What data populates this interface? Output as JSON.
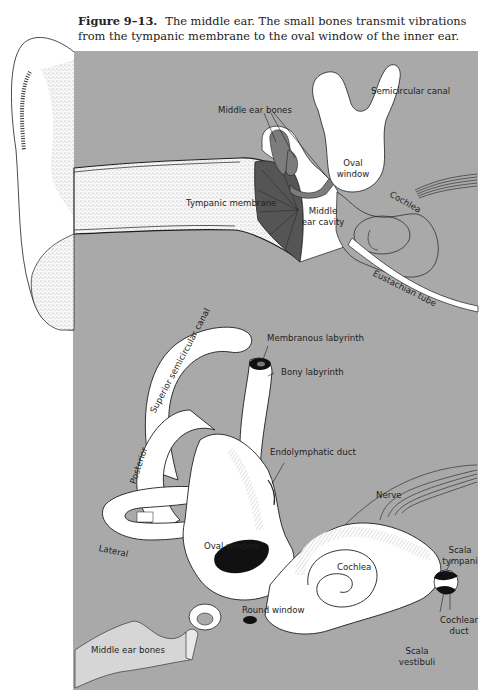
{
  "figure": {
    "number": "Figure 9–13.",
    "caption": "The middle ear. The small bones transmit vibrations from the tympanic membrane to the oval window of the inner ear."
  },
  "colors": {
    "panel_gray": "#a9a9a9",
    "page_white": "#ffffff",
    "line": "#1e1e1e",
    "dark_fill": "#111111",
    "bone_gray": "#7c7c7c"
  },
  "upper_diagram": {
    "title": "Middle ear cross-section",
    "labels": {
      "semicircular_canal": "Semicircular canal",
      "middle_ear_bones": "Middle ear bones",
      "oval_window_1": "Oval",
      "oval_window_2": "window",
      "tympanic_membrane": "Tympanic membrane",
      "middle_ear_cavity_1": "Middle",
      "middle_ear_cavity_2": "ear cavity",
      "cochlea": "Cochlea",
      "eustachian_tube": "Eustachian tube"
    }
  },
  "lower_diagram": {
    "title": "Inner ear labyrinth",
    "labels": {
      "superior_canal": "Superior semicircular canal",
      "membranous_labyrinth": "Membranous labyrinth",
      "bony_labyrinth": "Bony labyrinth",
      "endolymphatic_duct": "Endolymphatic duct",
      "posterior": "Posterior",
      "lateral": "Lateral",
      "nerve": "Nerve",
      "oval_window": "Oval window",
      "cochlea": "Cochlea",
      "scala_tympani_1": "Scala",
      "scala_tympani_2": "tympani",
      "round_window": "Round window",
      "cochlear_duct_1": "Cochlear",
      "cochlear_duct_2": "duct",
      "scala_vestibuli_1": "Scala",
      "scala_vestibuli_2": "vestibuli",
      "middle_ear_bones": "Middle ear bones"
    }
  }
}
